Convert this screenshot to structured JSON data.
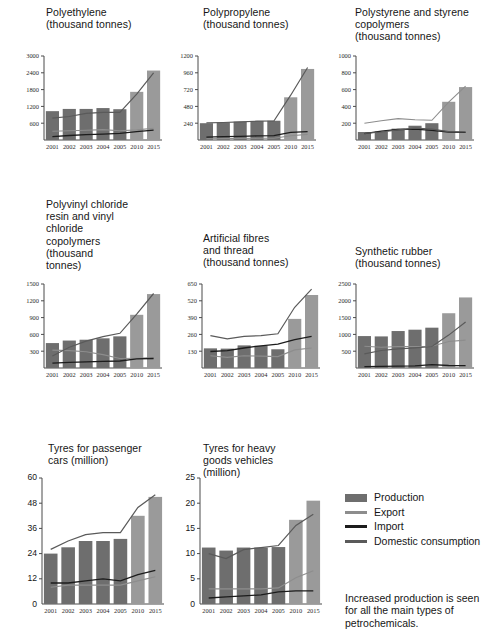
{
  "page": {
    "background": "#ffffff",
    "bar_production_color": "#6e6e6e",
    "bar_production_light_color": "#9a9a9a",
    "line_export_color": "#8d8d8d",
    "line_import_color": "#1c1c1c",
    "line_domestic_color": "#5a5a5a",
    "axis_color": "#4a4a4a"
  },
  "legend": {
    "name": "series-legend",
    "items": [
      {
        "label": "Production",
        "type": "swatch",
        "color": "#6e6e6e"
      },
      {
        "label": "Export",
        "type": "line",
        "color": "#8d8d8d"
      },
      {
        "label": "Import",
        "type": "line",
        "color": "#1c1c1c"
      },
      {
        "label": "Domestic consumption",
        "type": "line",
        "color": "#5a5a5a"
      }
    ]
  },
  "caption": {
    "text": "Increased production is seen\nfor all the main types of\npetrochemicals."
  },
  "chart_data": [
    {
      "id": "polyethylene",
      "type": "bar",
      "title": "Polyethylene\n(thousand tonnes)",
      "xlabel": "",
      "ylabel": "",
      "categories": [
        "2001",
        "2002",
        "2003",
        "2004",
        "2005",
        "2010",
        "2015"
      ],
      "yticks": [
        600,
        1200,
        1800,
        2400,
        3000
      ],
      "ylim": [
        0,
        3000
      ],
      "grid": false,
      "legend_position": "external",
      "series": [
        {
          "name": "Production",
          "type": "bar",
          "values": [
            1030,
            1110,
            1110,
            1140,
            1100,
            1720,
            2480
          ]
        },
        {
          "name": "Export",
          "type": "line",
          "values": [
            310,
            330,
            350,
            370,
            330,
            360,
            420
          ]
        },
        {
          "name": "Import",
          "type": "line",
          "values": [
            120,
            160,
            190,
            210,
            240,
            300,
            350
          ]
        },
        {
          "name": "Domestic consumption",
          "type": "line",
          "values": [
            780,
            840,
            950,
            990,
            990,
            1640,
            2400
          ]
        }
      ]
    },
    {
      "id": "polypropylene",
      "type": "bar",
      "title": "Polypropylene\n(thousand tonnes)",
      "categories": [
        "2001",
        "2002",
        "2003",
        "2004",
        "2005",
        "2010",
        "2015"
      ],
      "yticks": [
        240,
        480,
        720,
        960,
        1200
      ],
      "ylim": [
        0,
        1200
      ],
      "grid": false,
      "series": [
        {
          "name": "Production",
          "type": "bar",
          "values": [
            240,
            252,
            262,
            272,
            275,
            610,
            1015
          ]
        },
        {
          "name": "Export",
          "type": "line",
          "values": [
            18,
            20,
            22,
            24,
            26,
            60,
            80
          ]
        },
        {
          "name": "Import",
          "type": "line",
          "values": [
            40,
            48,
            52,
            58,
            62,
            110,
            118
          ]
        },
        {
          "name": "Domestic consumption",
          "type": "line",
          "values": [
            245,
            250,
            258,
            268,
            272,
            640,
            1035
          ]
        }
      ]
    },
    {
      "id": "polystyrene",
      "type": "bar",
      "title": "Polystyrene and styrene\ncopolymers\n(thousand tonnes)",
      "categories": [
        "2001",
        "2002",
        "2003",
        "2004",
        "2005",
        "2010",
        "2015"
      ],
      "yticks": [
        200,
        400,
        600,
        800,
        1000
      ],
      "ylim": [
        0,
        1000
      ],
      "grid": false,
      "series": [
        {
          "name": "Production",
          "type": "bar",
          "values": [
            95,
            100,
            135,
            170,
            200,
            455,
            630
          ]
        },
        {
          "name": "Export",
          "type": "line",
          "values": [
            200,
            230,
            255,
            240,
            235,
            450,
            640
          ]
        },
        {
          "name": "Import",
          "type": "line",
          "values": [
            75,
            105,
            125,
            130,
            115,
            95,
            92
          ]
        },
        {
          "name": "Domestic consumption",
          "type": "line",
          "values": [
            80,
            95,
            120,
            140,
            130,
            100,
            95
          ]
        }
      ]
    },
    {
      "id": "pvc",
      "type": "bar",
      "title": "Polyvinyl chloride\nresin and vinyl\nchloride\ncopolymers\n(thousand\ntonnes)",
      "categories": [
        "2001",
        "2002",
        "2003",
        "2004",
        "2005",
        "2010",
        "2015"
      ],
      "yticks": [
        300,
        600,
        900,
        1200,
        1500
      ],
      "ylim": [
        0,
        1500
      ],
      "grid": false,
      "series": [
        {
          "name": "Production",
          "type": "bar",
          "values": [
            445,
            490,
            505,
            530,
            565,
            950,
            1320
          ]
        },
        {
          "name": "Export",
          "type": "line",
          "values": [
            320,
            310,
            290,
            240,
            170,
            175,
            185
          ]
        },
        {
          "name": "Import",
          "type": "line",
          "values": [
            85,
            100,
            110,
            120,
            125,
            165,
            170
          ]
        },
        {
          "name": "Domestic consumption",
          "type": "line",
          "values": [
            215,
            370,
            480,
            560,
            620,
            960,
            1330
          ]
        }
      ]
    },
    {
      "id": "artificial-fibres",
      "type": "bar",
      "title": "Artificial fibres\nand thread\n(thousand tonnes)",
      "categories": [
        "2001",
        "2002",
        "2003",
        "2004",
        "2005",
        "2010",
        "2015"
      ],
      "yticks": [
        130,
        260,
        390,
        520,
        650
      ],
      "ylim": [
        0,
        650
      ],
      "grid": false,
      "series": [
        {
          "name": "Production",
          "type": "bar",
          "values": [
            152,
            150,
            175,
            172,
            145,
            380,
            565
          ]
        },
        {
          "name": "Export",
          "type": "line",
          "values": [
            95,
            82,
            95,
            92,
            88,
            140,
            155
          ]
        },
        {
          "name": "Import",
          "type": "line",
          "values": [
            128,
            135,
            155,
            172,
            185,
            220,
            245
          ]
        },
        {
          "name": "Domestic consumption",
          "type": "line",
          "values": [
            250,
            225,
            245,
            250,
            265,
            470,
            610
          ]
        }
      ]
    },
    {
      "id": "synthetic-rubber",
      "type": "bar",
      "title": "Synthetic rubber\n(thousand tonnes)",
      "categories": [
        "2001",
        "2002",
        "2003",
        "2004",
        "2005",
        "2010",
        "2015"
      ],
      "yticks": [
        500,
        1000,
        1500,
        2000,
        2500
      ],
      "ylim": [
        0,
        2500
      ],
      "grid": false,
      "series": [
        {
          "name": "Production",
          "type": "bar",
          "values": [
            950,
            940,
            1100,
            1140,
            1200,
            1630,
            2100
          ]
        },
        {
          "name": "Export",
          "type": "line",
          "values": [
            650,
            620,
            640,
            640,
            650,
            790,
            830
          ]
        },
        {
          "name": "Import",
          "type": "line",
          "values": [
            40,
            50,
            55,
            65,
            100,
            75,
            70
          ]
        },
        {
          "name": "Domestic consumption",
          "type": "line",
          "values": [
            420,
            520,
            570,
            600,
            640,
            980,
            1370
          ]
        }
      ]
    },
    {
      "id": "tyres-passenger-cars",
      "type": "bar",
      "title": "Tyres for passenger\ncars (million)",
      "categories": [
        "2001",
        "2002",
        "2003",
        "2004",
        "2005",
        "2010",
        "2015"
      ],
      "yticks": [
        12,
        24,
        36,
        48,
        60
      ],
      "ylim": [
        0,
        60
      ],
      "grid": false,
      "series": [
        {
          "name": "Production",
          "type": "bar",
          "values": [
            24,
            27,
            30,
            30,
            31,
            42,
            51
          ]
        },
        {
          "name": "Export",
          "type": "line",
          "values": [
            8,
            9,
            9,
            9,
            9,
            11,
            13
          ]
        },
        {
          "name": "Import",
          "type": "line",
          "values": [
            10,
            10,
            11,
            12,
            11,
            14,
            16
          ]
        },
        {
          "name": "Domestic consumption",
          "type": "line",
          "values": [
            26,
            30,
            33,
            34,
            34,
            46,
            52
          ]
        }
      ]
    },
    {
      "id": "tyres-heavy-goods",
      "type": "bar",
      "title": "Tyres for heavy\ngoods vehicles\n(million)",
      "categories": [
        "2001",
        "2002",
        "2003",
        "2004",
        "2005",
        "2010",
        "2015"
      ],
      "yticks": [
        5,
        10,
        15,
        20,
        25
      ],
      "ylim": [
        0,
        25
      ],
      "grid": false,
      "series": [
        {
          "name": "Production",
          "type": "bar",
          "values": [
            11.2,
            10.6,
            11.2,
            11.2,
            11.3,
            16.7,
            20.5
          ]
        },
        {
          "name": "Export",
          "type": "line",
          "values": [
            3.0,
            3.0,
            3.0,
            3.0,
            3.2,
            5.2,
            6.6
          ]
        },
        {
          "name": "Import",
          "type": "line",
          "values": [
            1.2,
            1.4,
            1.6,
            1.8,
            2.4,
            2.6,
            2.6
          ]
        },
        {
          "name": "Domestic consumption",
          "type": "line",
          "values": [
            10.0,
            9.0,
            10.8,
            11.2,
            11.6,
            15.6,
            17.8
          ]
        }
      ]
    }
  ]
}
